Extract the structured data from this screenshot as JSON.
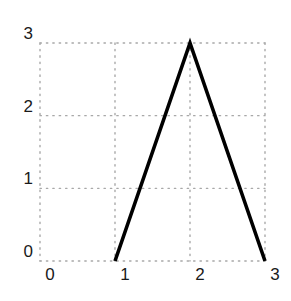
{
  "chart_data": {
    "type": "line",
    "title": "",
    "xlabel": "",
    "ylabel": "",
    "xlim": [
      0,
      3
    ],
    "ylim": [
      0,
      3
    ],
    "x_ticks": [
      "0",
      "1",
      "2",
      "3"
    ],
    "y_ticks": [
      "0",
      "1",
      "2",
      "3"
    ],
    "grid": true,
    "grid_style": "dotted",
    "legend": "none",
    "series": [
      {
        "name": "line",
        "color": "#000000",
        "x": [
          1,
          2,
          3
        ],
        "y": [
          0,
          3,
          0
        ]
      }
    ]
  }
}
